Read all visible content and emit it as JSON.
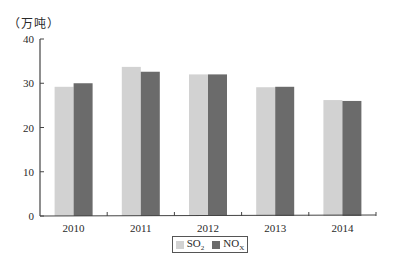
{
  "chart_data": {
    "type": "bar",
    "title": "",
    "unit_label": "（万吨）",
    "xlabel": "",
    "ylabel": "（万吨）",
    "categories": [
      "2010",
      "2011",
      "2012",
      "2013",
      "2014"
    ],
    "series": [
      {
        "name": "SO2",
        "display": "SO",
        "sub": "2",
        "color": "#d2d2d2",
        "values": [
          29.2,
          33.7,
          32.0,
          29.1,
          26.2
        ]
      },
      {
        "name": "NOx",
        "display": "NO",
        "sub": "X",
        "color": "#6b6b6b",
        "values": [
          30.0,
          32.6,
          32.0,
          29.2,
          26.0
        ]
      }
    ],
    "ylim": [
      0,
      40
    ],
    "yticks": [
      0,
      10,
      20,
      30,
      40
    ],
    "grid": false,
    "legend_position": "bottom-center"
  }
}
